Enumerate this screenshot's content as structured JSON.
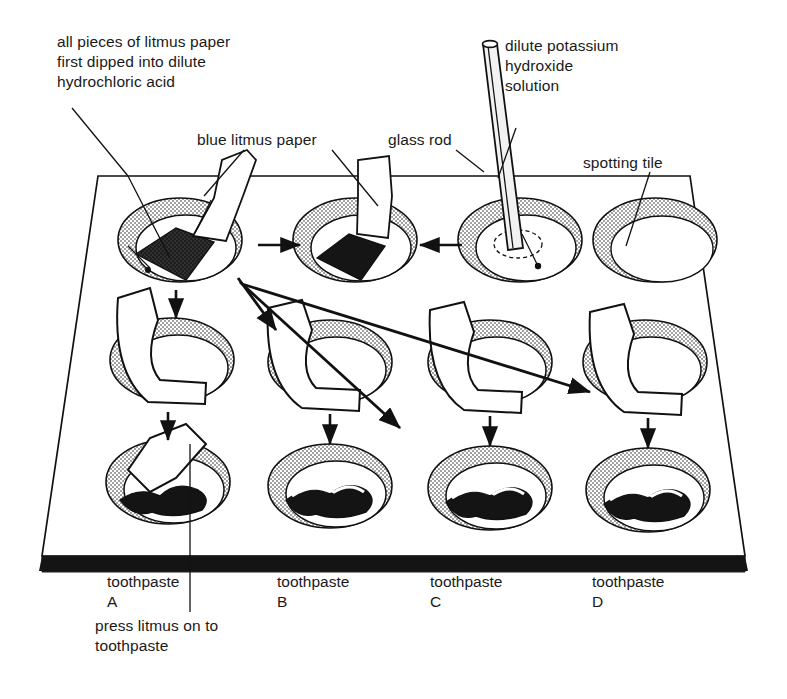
{
  "diagram": {
    "labels": {
      "acid_note": "all pieces of litmus paper\nfirst dipped into dilute\nhydrochloric acid",
      "blue_litmus": "blue litmus paper",
      "glass_rod": "glass rod",
      "potassium_hydroxide": "dilute potassium\nhydroxide\nsolution",
      "spotting_tile": "spotting tile",
      "press_note": "press litmus on to\ntoothpaste"
    },
    "columns": [
      {
        "label": "toothpaste\nA"
      },
      {
        "label": "toothpaste\nB"
      },
      {
        "label": "toothpaste\nC"
      },
      {
        "label": "toothpaste\nD"
      }
    ],
    "rows": [
      {
        "name": "row-1-dipping",
        "wells": [
          {
            "content": "litmus-strip-dipped-dark-tip"
          },
          {
            "content": "litmus-strip-dipped-dark-tip"
          },
          {
            "content": "glass-rod-in-well"
          },
          {
            "content": "empty-well"
          }
        ]
      },
      {
        "name": "row-2-bent-litmus",
        "wells": [
          {
            "content": "bent-litmus-strip"
          },
          {
            "content": "bent-litmus-strip"
          },
          {
            "content": "bent-litmus-strip"
          },
          {
            "content": "bent-litmus-strip"
          }
        ]
      },
      {
        "name": "row-3-toothpaste",
        "wells": [
          {
            "content": "toothpaste-blob-with-litmus"
          },
          {
            "content": "toothpaste-blob"
          },
          {
            "content": "toothpaste-blob"
          },
          {
            "content": "toothpaste-blob"
          }
        ]
      }
    ],
    "colors": {
      "ink": "#111111",
      "paper": "#ffffff",
      "stipple": "#8d8d8d",
      "tile_edge": "#1a1a1a",
      "blob": "#141414"
    }
  }
}
